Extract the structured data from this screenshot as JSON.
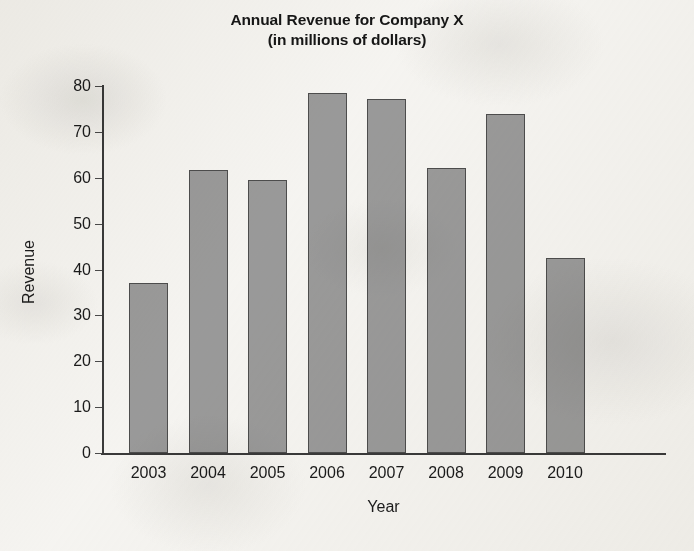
{
  "chart_data": {
    "type": "bar",
    "title": "Annual Revenue for Company X",
    "subtitle": "(in millions of dollars)",
    "title_lines": [
      "Annual Revenue for Company X",
      "(in millions of dollars)"
    ],
    "xlabel": "Year",
    "ylabel": "Revenue",
    "categories": [
      "2003",
      "2004",
      "2005",
      "2006",
      "2007",
      "2008",
      "2009",
      "2010"
    ],
    "values": [
      37,
      61.8,
      59.5,
      78.5,
      77.2,
      62.1,
      73.8,
      42.6
    ],
    "ylim": [
      0,
      80
    ],
    "yticks": [
      0,
      10,
      20,
      30,
      40,
      50,
      60,
      70,
      80
    ],
    "ytick_labels": [
      "0",
      "10",
      "20",
      "30",
      "40",
      "50",
      "60",
      "70",
      "80"
    ],
    "grid": false,
    "legend": null,
    "bar_color": "#9a9a9a",
    "bar_edge_color": "#4d4d4d",
    "axis_color": "#3a3a3a",
    "text_color": "#1b1b1b",
    "background_color": "#f6f5f2"
  }
}
